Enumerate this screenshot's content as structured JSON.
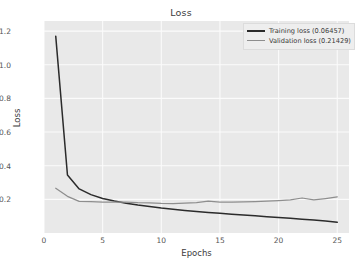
{
  "chart_data": {
    "type": "line",
    "title": "Loss",
    "xlabel": "Epochs",
    "ylabel": "Loss",
    "xlim": [
      0,
      26
    ],
    "ylim": [
      0.0,
      1.26
    ],
    "xticks": [
      "0",
      "5",
      "10",
      "15",
      "20",
      "25"
    ],
    "xtick_values": [
      0,
      5,
      10,
      15,
      20,
      25
    ],
    "yticks": [
      "0.2",
      "0.4",
      "0.6",
      "0.8",
      "1.0",
      "1.2"
    ],
    "ytick_values": [
      0.2,
      0.4,
      0.6,
      0.8,
      1.0,
      1.2
    ],
    "grid": true,
    "legend_position": "upper right",
    "x": [
      1,
      2,
      3,
      4,
      5,
      6,
      7,
      8,
      9,
      10,
      11,
      12,
      13,
      14,
      15,
      16,
      17,
      18,
      19,
      20,
      21,
      22,
      23,
      24,
      25
    ],
    "series": [
      {
        "name": "Training loss (0.06457)",
        "color": "#2b2b2b",
        "final_value": 0.06457,
        "values": [
          1.17,
          0.345,
          0.262,
          0.228,
          0.205,
          0.19,
          0.177,
          0.166,
          0.157,
          0.148,
          0.141,
          0.134,
          0.128,
          0.122,
          0.117,
          0.112,
          0.107,
          0.102,
          0.097,
          0.092,
          0.087,
          0.082,
          0.077,
          0.071,
          0.0646
        ]
      },
      {
        "name": "Validation loss (0.21429)",
        "color": "#8e8e8e",
        "final_value": 0.21429,
        "values": [
          0.266,
          0.218,
          0.188,
          0.186,
          0.183,
          0.184,
          0.183,
          0.18,
          0.179,
          0.176,
          0.175,
          0.178,
          0.181,
          0.189,
          0.184,
          0.184,
          0.185,
          0.187,
          0.19,
          0.193,
          0.197,
          0.208,
          0.197,
          0.205,
          0.2143
        ]
      }
    ]
  },
  "legend": {
    "items": [
      {
        "label": "Training loss (0.06457)"
      },
      {
        "label": "Validation loss (0.21429)"
      }
    ]
  }
}
